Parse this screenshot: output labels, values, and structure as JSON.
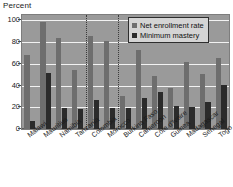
{
  "axis_title": "Percent",
  "legend": {
    "position": "top-right",
    "entries": [
      {
        "label": "Net enrollment rate",
        "color": "#6e6e6e",
        "key": "net"
      },
      {
        "label": "Minimum mastery",
        "color": "#2b2b2b",
        "key": "min"
      }
    ]
  },
  "yaxis": {
    "ticks": [
      "0",
      "20",
      "40",
      "60",
      "80",
      "100"
    ],
    "min": 0,
    "max": 105
  },
  "group_separators_after": [
    "Tanzania",
    "Morocco"
  ],
  "chart_data": {
    "type": "bar",
    "title": "",
    "subtitle": "",
    "xlabel": "",
    "ylabel": "Percent",
    "ylim": [
      0,
      105
    ],
    "grid": true,
    "legend_position": "top-right",
    "categories": [
      "Malawi",
      "Mauritius",
      "Namibia",
      "Tanzania",
      "Colombia",
      "Morocco",
      "Burkina Faso",
      "Cameroon",
      "Côte d'Ivoire",
      "Guinea",
      "Madagascar",
      "Senegal",
      "Togo"
    ],
    "series": [
      {
        "name": "Net enrollment rate",
        "color": "#6e6e6e",
        "values": [
          68,
          99,
          84,
          54,
          86,
          81,
          30,
          73,
          49,
          38,
          62,
          51,
          65
        ]
      },
      {
        "name": "Minimum mastery",
        "color": "#2b2b2b",
        "values": [
          7,
          52,
          19,
          18,
          27,
          19,
          19,
          29,
          34,
          21,
          20,
          25,
          41
        ]
      }
    ],
    "annotations": [
      "Dotted vertical separators divide country groups after Tanzania and after Morocco"
    ]
  }
}
